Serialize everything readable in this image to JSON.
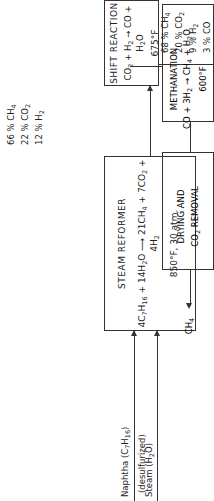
{
  "inputs": {
    "naphtha": "Naphtha (C7H16)",
    "desulfurized": "(desulfurized)",
    "steam": "Steam (H2O)"
  },
  "steam_reformer": {
    "title": "STEAM REFORMER",
    "reaction": "4C7H16 + 14H2O → 21CH4 + 7CO2 + 4H2",
    "conditions": "850°F, 30 atm."
  },
  "reformer_outlet": [
    "66 % CH4",
    "22 % CO2",
    "12 % H2"
  ],
  "shift_reaction": {
    "title": "SHIFT REACTION",
    "reaction": "CO2 + H2 → CO + H2O",
    "conditions": "675°F"
  },
  "shift_outlet": [
    "68 % CH4",
    "20 % CO2",
    "9 % H2",
    "3 % CO"
  ],
  "methanation": {
    "title": "METHANATION",
    "reaction": "CO + 3H2 → CH4 + H2O",
    "conditions": "600°F"
  },
  "methanation_outlet": [
    "79 % CH4",
    "21 % CO2"
  ],
  "drying": {
    "line1": "DRYING AND",
    "line2": "CO2 REMOVAL"
  },
  "product": "CH4"
}
